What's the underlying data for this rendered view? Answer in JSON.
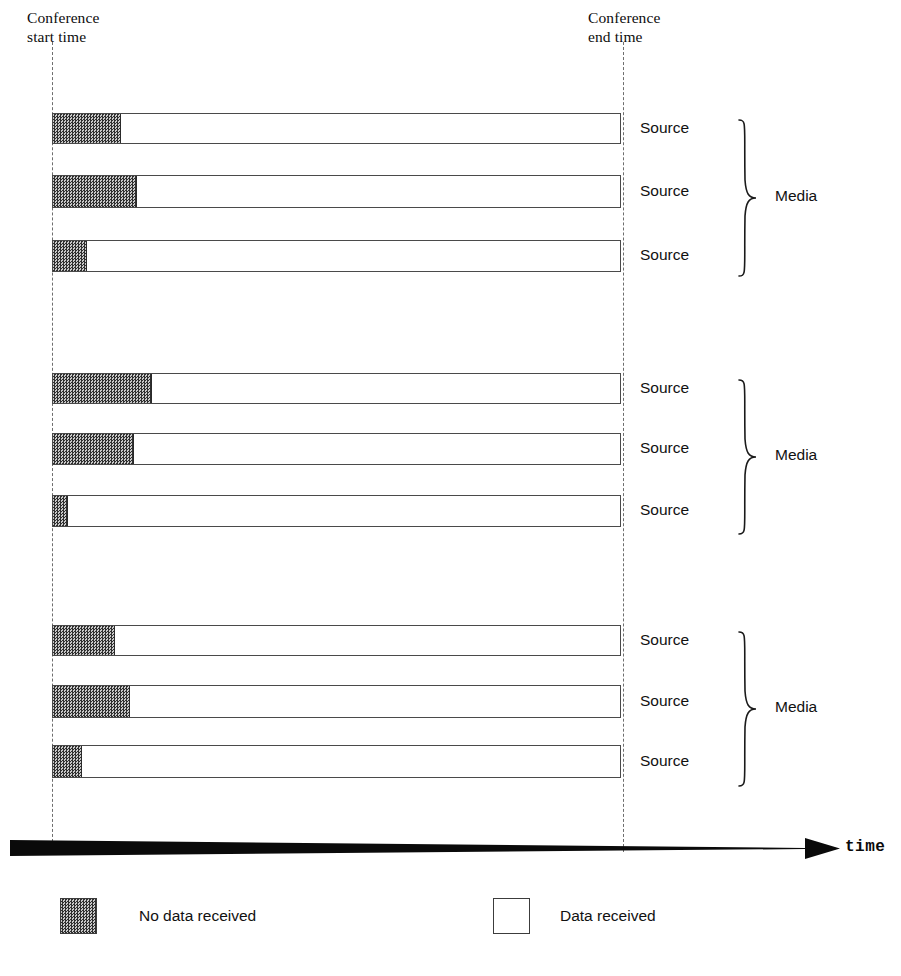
{
  "annotations": {
    "start_label": "Conference\nstart time",
    "end_label": "Conference\nend time",
    "time_axis_label": "time"
  },
  "legend": {
    "no_data": "No data received",
    "data": "Data received"
  },
  "labels": {
    "source": "Source",
    "media": "Media"
  },
  "colors": {
    "no_data_fill": "#4a4a4a",
    "data_fill": "#ffffff",
    "outline": "#4a4a4a",
    "guide": "#6e6e6e",
    "axis": "#0a0a0a"
  },
  "chart_data": {
    "type": "bar",
    "title": "",
    "xlabel": "time",
    "ylabel": "",
    "orientation": "horizontal",
    "stacked": true,
    "grid": false,
    "legend_position": "bottom",
    "x_axis": {
      "start_marker": "Conference start time",
      "end_marker": "Conference end time",
      "start_px": 52,
      "end_px": 623,
      "bar_total_px": 569
    },
    "series": [
      {
        "name": "No data received",
        "fill": "hatched-dark"
      },
      {
        "name": "Data received",
        "fill": "white"
      }
    ],
    "groups": [
      {
        "group_label": "Media",
        "rows": [
          {
            "label": "Source",
            "no_data_px": 68,
            "data_px": 501,
            "no_data_fraction": 0.12,
            "top": 113,
            "height": 31
          },
          {
            "label": "Source",
            "no_data_px": 84,
            "data_px": 485,
            "no_data_fraction": 0.148,
            "top": 175,
            "height": 33
          },
          {
            "label": "Source",
            "no_data_px": 34,
            "data_px": 535,
            "no_data_fraction": 0.06,
            "top": 240,
            "height": 32
          }
        ]
      },
      {
        "group_label": "Media",
        "rows": [
          {
            "label": "Source",
            "no_data_px": 99,
            "data_px": 470,
            "no_data_fraction": 0.174,
            "top": 373,
            "height": 31
          },
          {
            "label": "Source",
            "no_data_px": 81,
            "data_px": 488,
            "no_data_fraction": 0.142,
            "top": 433,
            "height": 32
          },
          {
            "label": "Source",
            "no_data_px": 15,
            "data_px": 554,
            "no_data_fraction": 0.026,
            "top": 495,
            "height": 32
          }
        ]
      },
      {
        "group_label": "Media",
        "rows": [
          {
            "label": "Source",
            "no_data_px": 62,
            "data_px": 507,
            "no_data_fraction": 0.109,
            "top": 625,
            "height": 31
          },
          {
            "label": "Source",
            "no_data_px": 77,
            "data_px": 492,
            "no_data_fraction": 0.135,
            "top": 685,
            "height": 33
          },
          {
            "label": "Source",
            "no_data_px": 29,
            "data_px": 540,
            "no_data_fraction": 0.051,
            "top": 745,
            "height": 33
          }
        ]
      }
    ]
  },
  "geometry": {
    "bar_left": 52,
    "bar_right": 621,
    "source_label_x": 640,
    "braces": [
      {
        "top": 118,
        "height": 160
      },
      {
        "top": 378,
        "height": 158
      },
      {
        "top": 630,
        "height": 158
      }
    ],
    "media_label_tops": [
      196,
      450,
      700
    ],
    "source_label_tops": [
      133,
      196,
      258,
      383,
      448,
      506,
      637,
      699,
      761
    ]
  }
}
